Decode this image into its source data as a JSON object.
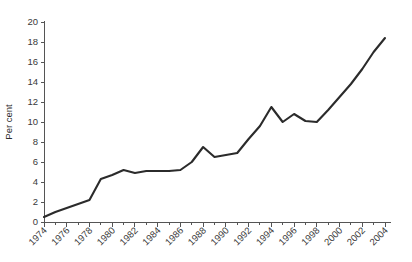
{
  "chart_data": {
    "type": "line",
    "title": "",
    "xlabel": "",
    "ylabel": "Per cent",
    "xlim": [
      1974,
      2004
    ],
    "ylim": [
      0,
      20
    ],
    "ytick_step": 2,
    "xtick_step_major": 2,
    "xtick_step_minor": 1,
    "grid": false,
    "legend": "none",
    "line_color": "#2b2b2b",
    "yticks": [
      "0",
      "2",
      "4",
      "6",
      "8",
      "10",
      "12",
      "14",
      "16",
      "18",
      "20"
    ],
    "xticks": [
      "1974",
      "1976",
      "1978",
      "1980",
      "1982",
      "1984",
      "1986",
      "1988",
      "1990",
      "1992",
      "1994",
      "1996",
      "1998",
      "2000",
      "2002",
      "2004"
    ],
    "x": [
      1974,
      1975,
      1976,
      1977,
      1978,
      1979,
      1980,
      1981,
      1982,
      1983,
      1984,
      1985,
      1986,
      1987,
      1988,
      1989,
      1990,
      1991,
      1992,
      1993,
      1994,
      1995,
      1996,
      1997,
      1998,
      1999,
      2000,
      2001,
      2002,
      2003,
      2004
    ],
    "values": [
      0.5,
      1.0,
      1.4,
      1.8,
      2.2,
      4.3,
      4.7,
      5.2,
      4.9,
      5.1,
      5.1,
      5.1,
      5.2,
      6.0,
      7.5,
      6.5,
      6.7,
      6.9,
      8.3,
      9.6,
      11.5,
      10.0,
      10.8,
      10.1,
      10.0,
      11.2,
      12.5,
      13.8,
      15.3,
      17.0,
      18.4
    ],
    "series": [
      {
        "name": "Per cent",
        "values": [
          0.5,
          1.0,
          1.4,
          1.8,
          2.2,
          4.3,
          4.7,
          5.2,
          4.9,
          5.1,
          5.1,
          5.1,
          5.2,
          6.0,
          7.5,
          6.5,
          6.7,
          6.9,
          8.3,
          9.6,
          11.5,
          10.0,
          10.8,
          10.1,
          10.0,
          11.2,
          12.5,
          13.8,
          15.3,
          17.0,
          18.4
        ]
      }
    ]
  }
}
